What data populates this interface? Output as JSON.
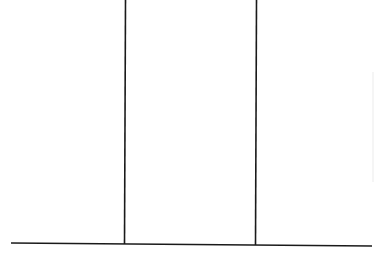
{
  "diagram": {
    "background": "#ffffff",
    "stroke_color": "#1a1a1a",
    "stroke_width": 1.6,
    "faint_mark_color": "#f2f2f2",
    "lines": [
      {
        "id": "baseline",
        "x1": 11,
        "y1": 243,
        "x2": 372,
        "y2": 246
      },
      {
        "id": "left-vertical",
        "x1": 125.5,
        "y1": 0,
        "x2": 124.5,
        "y2": 244
      },
      {
        "id": "right-vertical",
        "x1": 256.5,
        "y1": 0,
        "x2": 255.5,
        "y2": 245
      }
    ],
    "faint_marks": [
      {
        "id": "right-edge-artifact",
        "x1": 373,
        "y1": 72,
        "x2": 373,
        "y2": 182
      }
    ]
  }
}
